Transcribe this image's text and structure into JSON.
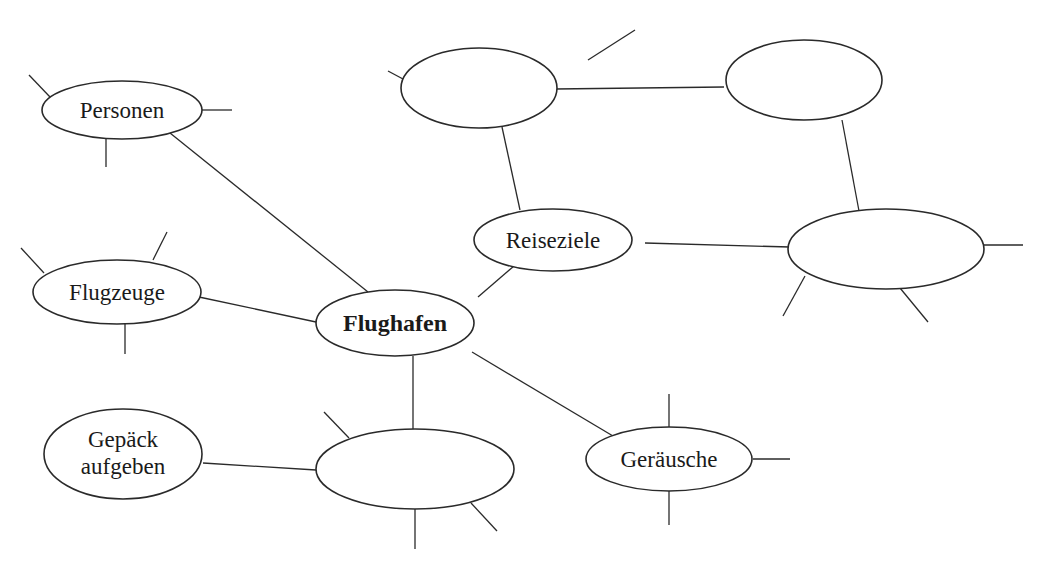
{
  "diagram": {
    "type": "mind-map",
    "center": {
      "id": "flughafen",
      "label": "Flughafen"
    },
    "nodes": [
      {
        "id": "personen",
        "label": "Personen"
      },
      {
        "id": "flugzeuge",
        "label": "Flugzeuge"
      },
      {
        "id": "gepaeck",
        "label_line1": "Gepäck",
        "label_line2": "aufgeben"
      },
      {
        "id": "reiseziele",
        "label": "Reiseziele"
      },
      {
        "id": "geraeusche",
        "label": "Geräusche"
      },
      {
        "id": "empty-bottom",
        "label": ""
      },
      {
        "id": "empty-top-left",
        "label": ""
      },
      {
        "id": "empty-top-right",
        "label": ""
      },
      {
        "id": "empty-right",
        "label": ""
      }
    ],
    "edges": [
      [
        "flughafen",
        "personen"
      ],
      [
        "flughafen",
        "flugzeuge"
      ],
      [
        "flughafen",
        "reiseziele"
      ],
      [
        "flughafen",
        "geraeusche"
      ],
      [
        "flughafen",
        "empty-bottom"
      ],
      [
        "empty-bottom",
        "gepaeck"
      ],
      [
        "reiseziele",
        "empty-top-left"
      ],
      [
        "reiseziele",
        "empty-right"
      ],
      [
        "empty-top-left",
        "empty-top-right"
      ],
      [
        "empty-top-right",
        "empty-right"
      ]
    ]
  }
}
